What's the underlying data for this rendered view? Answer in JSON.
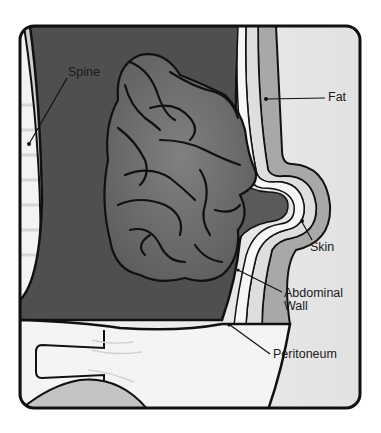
{
  "diagram": {
    "type": "anatomical-illustration",
    "labels": {
      "spine": "Spine",
      "fat": "Fat",
      "skin": "Skin",
      "abdominal_wall_line1": "Abdominal",
      "abdominal_wall_line2": "Wall",
      "peritoneum": "Peritoneum"
    },
    "colors": {
      "frame_stroke": "#111111",
      "cavity": "#4f4f4f",
      "intestine": "#6e6e6e",
      "intestine_highlight": "#8c8c8c",
      "fat_layer": "#dedede",
      "skin_layer": "#a8a8a8",
      "exterior": "#e9e9e9",
      "pelvis": "#f4f4f4",
      "leg": "#c4c4c4"
    }
  }
}
